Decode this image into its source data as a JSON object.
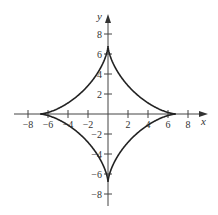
{
  "chart_data": {
    "type": "line",
    "title": "",
    "xlabel": "x",
    "ylabel": "y",
    "xlim": [
      -9.5,
      10
    ],
    "ylim": [
      -10,
      9.5
    ],
    "grid": false,
    "legend": null,
    "x_ticks": [
      -8,
      -6,
      -4,
      -2,
      2,
      4,
      6,
      8
    ],
    "y_ticks": [
      8,
      6,
      4,
      2,
      -2,
      -4,
      -6,
      -8
    ],
    "x_tick_labels": [
      "−8",
      "−6",
      "−4",
      "−2",
      "2",
      "4",
      "6",
      "8"
    ],
    "y_tick_labels": [
      "8",
      "6",
      "4",
      "2",
      "−2",
      "−4",
      "−6",
      "−8"
    ],
    "series": [
      {
        "name": "astroid",
        "equation": "x = a cos^3 t, y = a sin^3 t",
        "a": 6.8,
        "cusps": [
          [
            6.8,
            0
          ],
          [
            0,
            6.8
          ],
          [
            -6.8,
            0
          ],
          [
            0,
            -6.8
          ]
        ],
        "color": "#222222"
      }
    ]
  },
  "colors": {
    "curve": "#222222",
    "axis": "#444444"
  }
}
